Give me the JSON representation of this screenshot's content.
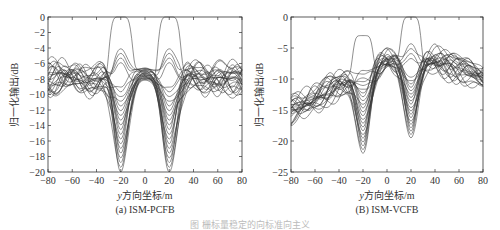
{
  "chart_data": [
    {
      "type": "line",
      "title": "(a) ISM-PCFB",
      "xlabel": "y方向坐标/m",
      "ylabel": "归一化输出/dB",
      "xlim": [
        -80,
        80
      ],
      "ylim": [
        -20,
        0
      ],
      "xticks": [
        -80,
        -60,
        -40,
        -20,
        0,
        20,
        40,
        60,
        80
      ],
      "yticks": [
        0,
        -2,
        -4,
        -6,
        -8,
        -10,
        -12,
        -14,
        -16,
        -18,
        -20
      ],
      "grid": false,
      "legend": null,
      "description": "Family of ~25 normalized beam-output curves; main-lobe peaks at 0 dB near y=-20 and y=20 m; deep nulls down to -20 dB at y=±20 m for most curves; sidelobe band between -6 and -10 dB elsewhere; central plateau around -6.5 to -8 dB at y=0",
      "features": {
        "main_peaks": [
          {
            "x": -20,
            "y": 0
          },
          {
            "x": 20,
            "y": 0
          }
        ],
        "nulls": [
          {
            "x": -20,
            "y": -20
          },
          {
            "x": 20,
            "y": -20
          }
        ],
        "secondary_peaks": [
          {
            "x": -20,
            "y": -3.5
          },
          {
            "x": 20,
            "y": -3.5
          }
        ],
        "sidelobe_band": [
          -10,
          -5.5
        ],
        "center_plateau": [
          -8,
          -6.5
        ]
      }
    },
    {
      "type": "line",
      "title": "(B) ISM-VCFB",
      "xlabel": "y方向坐标/m",
      "ylabel": "归一化输出/dB",
      "xlim": [
        -80,
        80
      ],
      "ylim": [
        -25,
        0
      ],
      "xticks": [
        -80,
        -60,
        -40,
        -20,
        0,
        20,
        40,
        60,
        80
      ],
      "yticks": [
        0,
        -5,
        -10,
        -15,
        -20,
        -25
      ],
      "grid": false,
      "legend": null,
      "description": "Family of ~25 normalized beam-output curves with rising trend from about -15 dB at y=-80 to about -7 dB at y=0..40, then -8 to -12 dB at y=80; main-lobe peak 0 dB near y=20, secondary peak about -2.5 dB near y=-20; nulls to about -22 dB at y=-20 and -19.5 dB at y=20",
      "features": {
        "main_peaks": [
          {
            "x": -20,
            "y": -2.5
          },
          {
            "x": 20,
            "y": 0
          }
        ],
        "nulls": [
          {
            "x": -20,
            "y": -22
          },
          {
            "x": 20,
            "y": -19.5
          }
        ],
        "trend_start": -15,
        "trend_mid": -7,
        "trend_end": -9.5
      }
    }
  ],
  "figure_caption": "图  栅标量稳定的向标准向主义"
}
